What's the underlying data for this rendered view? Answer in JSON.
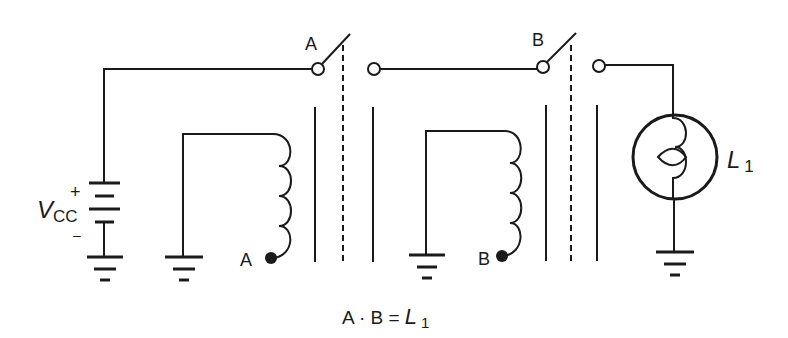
{
  "diagram": {
    "type": "relay AND logic circuit",
    "supply": {
      "label_main": "V",
      "label_sub": "CC",
      "plus": "+",
      "minus": "–"
    },
    "relays": [
      {
        "id": "A",
        "switch_label": "A",
        "coil_label": "A"
      },
      {
        "id": "B",
        "switch_label": "B",
        "coil_label": "B"
      }
    ],
    "lamp": {
      "label_main": "L",
      "label_sub": "1"
    },
    "equation": {
      "left": "A · B = ",
      "lamp_main": "L",
      "lamp_sub": "1"
    }
  },
  "colors": {
    "line": "#1a1a1a",
    "background": "#ffffff"
  }
}
